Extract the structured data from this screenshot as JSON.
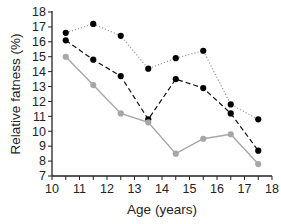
{
  "chart_data": {
    "type": "line",
    "title": "",
    "xlabel": "Age (years)",
    "ylabel": "Relative fatness (%)",
    "xlim": [
      10,
      18
    ],
    "ylim": [
      7,
      18
    ],
    "xticks": [
      10,
      11,
      12,
      13,
      14,
      15,
      16,
      17,
      18
    ],
    "yticks": [
      7,
      8,
      9,
      10,
      11,
      12,
      13,
      14,
      15,
      16,
      17,
      18
    ],
    "grid": false,
    "legend": null,
    "x": [
      10.5,
      11.5,
      12.5,
      13.5,
      14.5,
      15.5,
      16.5,
      17.5
    ],
    "series": [
      {
        "name": "dotted (black markers)",
        "style": "dotted",
        "line_color": "#9a9a9a",
        "marker_color": "#000000",
        "values": [
          16.6,
          17.2,
          16.4,
          14.2,
          14.9,
          15.4,
          11.8,
          10.8
        ]
      },
      {
        "name": "dashed (black markers)",
        "style": "dashed",
        "line_color": "#111111",
        "marker_color": "#000000",
        "values": [
          16.1,
          14.8,
          13.7,
          10.8,
          13.5,
          12.9,
          11.2,
          8.7
        ]
      },
      {
        "name": "solid (gray markers)",
        "style": "solid",
        "line_color": "#a6a6a6",
        "marker_color": "#a6a6a6",
        "values": [
          15.0,
          13.1,
          11.2,
          10.6,
          8.5,
          9.5,
          9.8,
          7.8
        ]
      }
    ]
  }
}
